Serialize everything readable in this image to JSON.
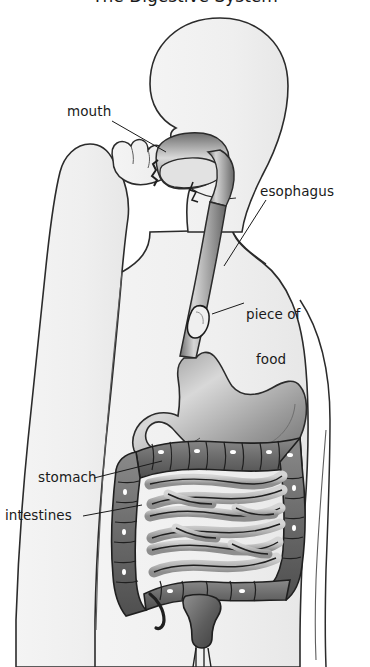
{
  "figure": {
    "title_clipped": "The Digestive System",
    "background_color": "#ffffff",
    "body_fill_color": "#f0f0f0",
    "outline_color": "#2b2b2b",
    "organ_dark_color": "#5a5a5a",
    "organ_light_color": "#c9c9c9"
  },
  "labels": {
    "mouth": "mouth",
    "esophagus": "esophagus",
    "piece_of_food_line1": "piece of",
    "piece_of_food_line2": "food",
    "stomach": "stomach",
    "intestines": "intestines"
  },
  "parts": {
    "head": "head-silhouette",
    "arm": "raised-arm-silhouette",
    "hand": "fist-holding-food",
    "torso": "torso-silhouette",
    "oral_cavity": "mouth-cavity",
    "tongue": "tongue",
    "esophagus_tube": "esophagus-tube",
    "food_bolus": "piece-of-food-in-esophagus",
    "stomach_organ": "stomach",
    "large_intestine": "large-intestine",
    "small_intestine": "small-intestine",
    "rectum": "rectum"
  }
}
